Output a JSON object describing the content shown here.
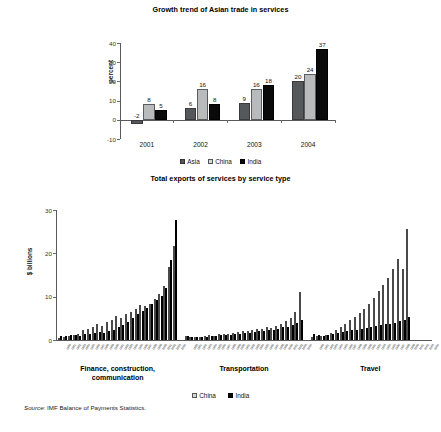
{
  "figure": {
    "source_prefix": "Source:",
    "source_text": "IMF Balance of Payments Statistics."
  },
  "chart_data": [
    {
      "type": "bar",
      "title": "Growth trend of Asian trade in services",
      "xlabel": "",
      "ylabel": "percent",
      "ylim": [
        -10,
        40
      ],
      "yticks": [
        "40",
        "30",
        "20",
        "10",
        "0",
        "-10"
      ],
      "ytick_values": [
        40,
        30,
        20,
        10,
        0,
        -10
      ],
      "grid": false,
      "legend_position": "bottom-center",
      "categories": [
        "2001",
        "2002",
        "2003",
        "2004"
      ],
      "series": [
        {
          "name": "Asia",
          "color": "#55585a",
          "values": [
            -2,
            6,
            9,
            20
          ]
        },
        {
          "name": "China",
          "color": "#b9babb",
          "values": [
            8,
            16,
            16,
            24
          ]
        },
        {
          "name": "India",
          "color": "#0a0a0a",
          "values": [
            5,
            8,
            18,
            37
          ]
        }
      ],
      "data_labels": [
        "-2",
        "8",
        "5",
        "6",
        "16",
        "8",
        "9",
        "16",
        "18",
        "20",
        "24",
        "37"
      ]
    },
    {
      "type": "bar",
      "title": "Total exports of services by service type",
      "xlabel": "",
      "ylabel": "$ billions",
      "ylim": [
        0,
        30
      ],
      "yticks": [
        "30",
        "20",
        "10",
        "0"
      ],
      "ytick_values": [
        30,
        20,
        10,
        0
      ],
      "grid": false,
      "legend_position": "bottom-center",
      "panels": [
        {
          "name": "Finance, construction, communication",
          "label_lines": [
            "Finance, construction,",
            "communication"
          ],
          "x": [
            "1980",
            "1981",
            "1982",
            "1983",
            "1984",
            "1985",
            "1986",
            "1987",
            "1988",
            "1989",
            "1990",
            "1991",
            "1992",
            "1993",
            "1994",
            "1995",
            "1996",
            "1997",
            "1998",
            "1999",
            "2000",
            "2001",
            "2002",
            "2003",
            "2004"
          ],
          "series": [
            {
              "name": "China",
              "color": "#b4b5b6",
              "values": [
                0.4,
                0.7,
                0.9,
                1.1,
                1.5,
                2.2,
                2.6,
                3.0,
                3.6,
                3.2,
                4.1,
                4.6,
                5.5,
                5.1,
                6.1,
                6.4,
                7.2,
                8.0,
                7.8,
                8.4,
                9.4,
                10.6,
                12.5,
                16.8,
                21.6
              ]
            },
            {
              "name": "India",
              "color": "#0d0d0d",
              "values": [
                0.9,
                1.0,
                1.1,
                1.2,
                1.0,
                1.3,
                1.5,
                1.6,
                1.8,
                1.7,
                2.1,
                2.4,
                2.9,
                3.4,
                4.2,
                5.0,
                6.0,
                6.8,
                7.4,
                8.2,
                9.3,
                10.2,
                12.1,
                18.4,
                27.8
              ]
            }
          ]
        },
        {
          "name": "Transportation",
          "label_lines": [
            "Transportation"
          ],
          "x": [
            "1980",
            "1981",
            "1982",
            "1983",
            "1984",
            "1985",
            "1986",
            "1987",
            "1988",
            "1989",
            "1990",
            "1991",
            "1992",
            "1993",
            "1994",
            "1995",
            "1996",
            "1997",
            "1998",
            "1999",
            "2000",
            "2001",
            "2002",
            "2003",
            "2004"
          ],
          "series": [
            {
              "name": "China",
              "color": "#b4b5b6",
              "values": [
                1.0,
                0.8,
                0.7,
                0.8,
                0.9,
                1.1,
                1.0,
                1.3,
                1.5,
                1.4,
                1.7,
                1.8,
                2.1,
                2.0,
                2.4,
                2.6,
                2.5,
                3.0,
                2.8,
                3.2,
                3.8,
                4.3,
                5.0,
                6.5,
                11.0
              ]
            },
            {
              "name": "India",
              "color": "#0d0d0d",
              "values": [
                0.9,
                0.8,
                0.7,
                0.8,
                0.8,
                0.9,
                1.0,
                1.1,
                1.2,
                1.2,
                1.4,
                1.5,
                1.7,
                1.6,
                1.9,
                2.0,
                2.1,
                2.4,
                2.3,
                2.6,
                2.9,
                3.1,
                3.4,
                4.0,
                4.6
              ]
            }
          ]
        },
        {
          "name": "Travel",
          "label_lines": [
            "Travel"
          ],
          "x": [
            "1980",
            "1981",
            "1982",
            "1983",
            "1984",
            "1985",
            "1986",
            "1987",
            "1988",
            "1989",
            "1990",
            "1991",
            "1992",
            "1993",
            "1994",
            "1995",
            "1996",
            "1997",
            "1998",
            "1999",
            "2000",
            "2001",
            "2002",
            "2003",
            "2004"
          ],
          "series": [
            {
              "name": "China",
              "color": "#b4b5b6",
              "values": [
                0.6,
                0.9,
                1.0,
                1.2,
                1.6,
                2.4,
                3.0,
                3.6,
                4.6,
                5.4,
                6.3,
                7.1,
                8.4,
                9.6,
                11.2,
                12.7,
                14.3,
                16.4,
                18.6,
                16.4,
                25.7
              ]
            },
            {
              "name": "India",
              "color": "#0d0d0d",
              "values": [
                1.4,
                1.1,
                1.0,
                1.2,
                1.4,
                1.6,
                1.8,
                2.0,
                2.2,
                2.4,
                2.6,
                2.7,
                3.0,
                3.2,
                3.4,
                3.6,
                3.8,
                4.0,
                4.3,
                4.6,
                5.4
              ]
            }
          ]
        }
      ],
      "legend": [
        {
          "name": "China",
          "color": "#b4b5b6"
        },
        {
          "name": "India",
          "color": "#0d0d0d"
        }
      ]
    }
  ]
}
